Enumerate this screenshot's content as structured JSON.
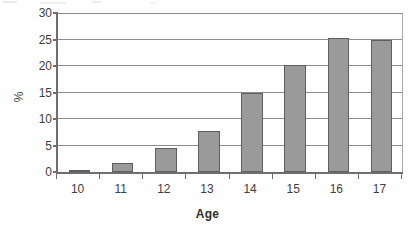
{
  "chart_data": {
    "type": "bar",
    "title": "",
    "subtitle": "",
    "xlabel": "Age",
    "ylabel": "%",
    "categories": [
      "10",
      "11",
      "12",
      "13",
      "14",
      "15",
      "16",
      "17"
    ],
    "values": [
      0.2,
      1.7,
      4.5,
      7.7,
      14.9,
      20.2,
      25.3,
      25.0
    ],
    "series": [
      {
        "name": "",
        "values": [
          0.2,
          1.7,
          4.5,
          7.7,
          14.9,
          20.2,
          25.3,
          25.0
        ]
      }
    ],
    "ylim": [
      0,
      30
    ],
    "yticks": [
      0,
      5,
      10,
      15,
      20,
      25,
      30
    ],
    "ytick_labels": [
      "0",
      "5",
      "10",
      "15",
      "20",
      "25",
      "30"
    ],
    "grid": true,
    "grid_axis": "y",
    "legend": false,
    "legend_position": "none",
    "annotations": [],
    "colors": {
      "bar_fill": "#9a9a9a",
      "bar_border": "#5e5e5e",
      "gridline": "#8c8c8c",
      "axis": "#6e6e6e",
      "text": "#3f3f3f",
      "background": "#ffffff"
    }
  }
}
